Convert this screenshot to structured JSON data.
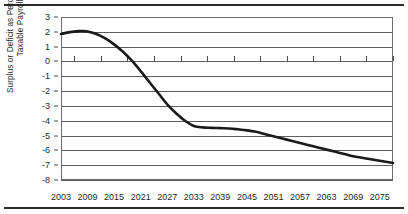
{
  "figure": {
    "has_top_rule": true,
    "has_bottom_rule": true
  },
  "chart_data": {
    "type": "line",
    "title": "",
    "xlabel": "",
    "ylabel_lines": [
      "Surplus or Deficit as Percentage of",
      "Taxable Payroll"
    ],
    "ylabel": "Surplus or Deficit as Percentage of Taxable Payroll",
    "xlim": [
      2003,
      2078
    ],
    "ylim": [
      -8,
      3
    ],
    "grid": true,
    "legend": "none",
    "y_ticks": [
      3,
      2,
      1,
      0,
      -1,
      -2,
      -3,
      -4,
      -5,
      -6,
      -7,
      -8
    ],
    "y_tick_labels": [
      "3",
      "2",
      "1",
      "0",
      "-1",
      "-2",
      "-3",
      "-4",
      "-5",
      "-6",
      "-7",
      "-8"
    ],
    "x_ticks": [
      2003,
      2009,
      2015,
      2021,
      2027,
      2033,
      2039,
      2045,
      2051,
      2057,
      2063,
      2069,
      2075
    ],
    "x_tick_labels": [
      "2003",
      "2009",
      "2015",
      "2021",
      "2027",
      "2033",
      "2039",
      "2045",
      "2051",
      "2057",
      "2063",
      "2069",
      "2075"
    ],
    "x_minor_ticks": [
      2006,
      2012,
      2018,
      2024,
      2030,
      2036,
      2042,
      2048,
      2054,
      2060,
      2066,
      2072,
      2078
    ],
    "minor_tick_axis_value": 0,
    "line_color": "#1a1a1a",
    "line_width": 2.6,
    "series": [
      {
        "name": "Surplus or Deficit as Percentage of Taxable Payroll",
        "x": [
          2003,
          2005,
          2007,
          2008,
          2009,
          2011,
          2013,
          2015,
          2017,
          2019,
          2021,
          2023,
          2025,
          2027,
          2029,
          2031,
          2033,
          2035,
          2037,
          2039,
          2041,
          2043,
          2045,
          2047,
          2049,
          2051,
          2053,
          2055,
          2057,
          2059,
          2061,
          2063,
          2065,
          2067,
          2069,
          2071,
          2073,
          2075,
          2078
        ],
        "y": [
          1.85,
          1.98,
          2.05,
          2.05,
          2.02,
          1.85,
          1.55,
          1.15,
          0.65,
          0.05,
          -0.65,
          -1.4,
          -2.15,
          -2.9,
          -3.5,
          -4.0,
          -4.35,
          -4.45,
          -4.48,
          -4.5,
          -4.52,
          -4.58,
          -4.65,
          -4.75,
          -4.9,
          -5.05,
          -5.2,
          -5.35,
          -5.5,
          -5.65,
          -5.8,
          -5.95,
          -6.1,
          -6.25,
          -6.4,
          -6.5,
          -6.6,
          -6.7,
          -6.85
        ]
      }
    ]
  }
}
